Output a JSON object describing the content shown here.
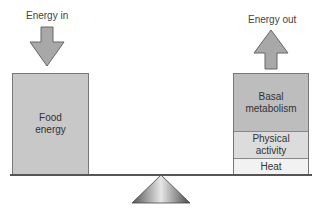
{
  "left": {
    "arrow_label": "Energy in",
    "box_label_line1": "Food",
    "box_label_line2": "energy"
  },
  "right": {
    "arrow_label": "Energy out",
    "segments": [
      {
        "line1": "Basal",
        "line2": "metabolism"
      },
      {
        "line1": "Physical",
        "line2": "activity"
      },
      {
        "line1": "Heat",
        "line2": ""
      }
    ]
  },
  "colors": {
    "box_fill": "#c8c8c8",
    "basal_fill": "#bdbdbd",
    "physical_fill": "#dcdcdc",
    "heat_fill": "#f2f2f2",
    "arrow_fill": "#a8a8a8",
    "outline": "#666666"
  }
}
